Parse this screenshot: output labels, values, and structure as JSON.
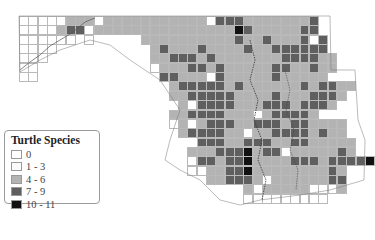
{
  "map": {
    "title": "Turtle Species",
    "grid": {
      "origin_x": 19,
      "origin_y": 16,
      "cell_w": 9.35,
      "cell_h": 9.35,
      "rows": [
        "00000222022222222222033322222223",
        "00002330222222222222222432222233",
        "000000.0.....22222222223223222303",
        "0000..........2322232222322333333",
        "000...........22333232222222333322",
        "00............02223323222223322322",
        "00.............332220322222322222",
        "................23333323222222323322",
        "................2233333222232223332",
        ".................20333322233323332",
        "................2233332220233332",
        "................0202333223332332222",
        ".................233332202233332322",
        "...................33322333223322222",
        "..................222333423302222232",
        "..................03323342222333233334",
        "..................00223342222222232",
        "....................223332022222233",
        "........................20222220002",
        "........................000000000"
      ],
      "start_cols": [
        0,
        0,
        0,
        0,
        0,
        0,
        0,
        0,
        0,
        0,
        0,
        0,
        0,
        0,
        0,
        0,
        0,
        0,
        0,
        0
      ]
    },
    "legend": {
      "title": "Turtle Species",
      "items": [
        {
          "label": "0",
          "class": "c0",
          "color": "#ffffff"
        },
        {
          "label": "1 - 3",
          "class": "c1",
          "color": "#fbfbfb"
        },
        {
          "label": "4 - 6",
          "class": "c2",
          "color": "#b3b3b3"
        },
        {
          "label": "7 - 9",
          "class": "c3",
          "color": "#5f5f5f"
        },
        {
          "label": "10 - 11",
          "class": "c4",
          "color": "#111111"
        }
      ]
    }
  }
}
